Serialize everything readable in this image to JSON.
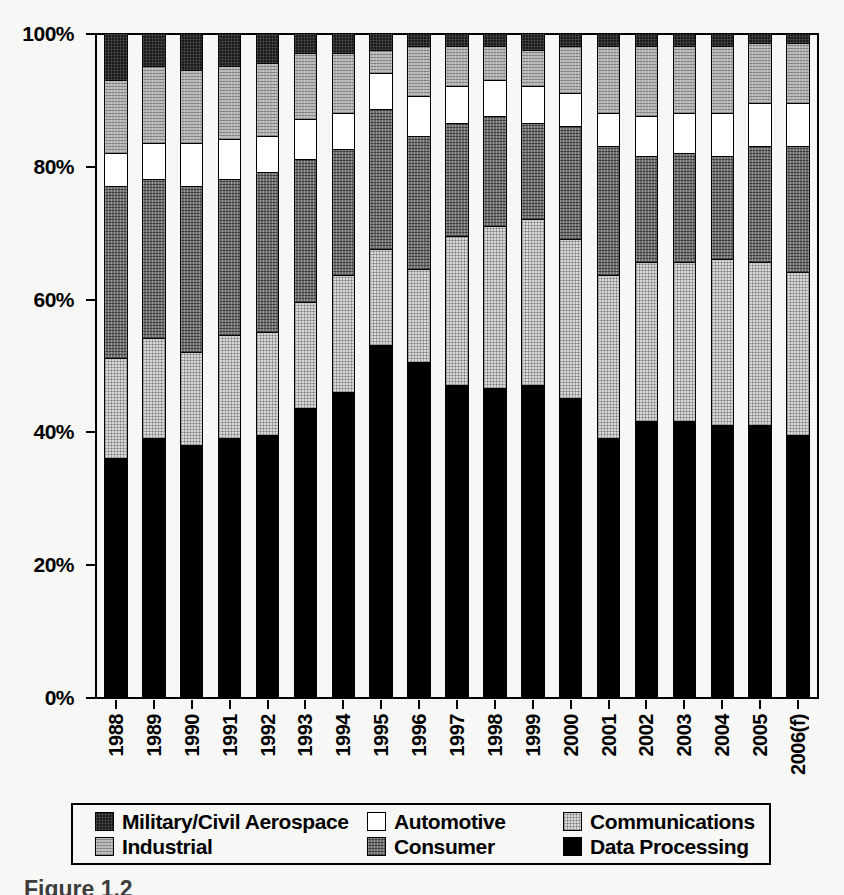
{
  "chart_data": {
    "type": "bar",
    "stacked": true,
    "stack_mode": "percent",
    "title": "",
    "subtitle": "",
    "xlabel": "",
    "ylabel": "",
    "ylim": [
      0,
      100
    ],
    "y_tick_labels": [
      "0%",
      "20%",
      "40%",
      "60%",
      "80%",
      "100%"
    ],
    "y_ticks": [
      0,
      20,
      40,
      60,
      80,
      100
    ],
    "grid": false,
    "legend_position": "bottom",
    "categories": [
      "1988",
      "1989",
      "1990",
      "1991",
      "1992",
      "1993",
      "1994",
      "1995",
      "1996",
      "1997",
      "1998",
      "1999",
      "2000",
      "2001",
      "2002",
      "2003",
      "2004",
      "2005",
      "2006(f)"
    ],
    "stack_order_bottom_to_top": [
      "Data Processing",
      "Communications",
      "Consumer",
      "Automotive",
      "Industrial",
      "Military/Civil Aerospace"
    ],
    "series": [
      {
        "name": "Data Processing",
        "color": "#000000",
        "values": [
          36.0,
          39.0,
          38.0,
          39.0,
          39.5,
          43.5,
          46.0,
          53.0,
          50.5,
          47.0,
          46.5,
          47.0,
          45.0,
          39.0,
          41.5,
          41.5,
          41.0,
          41.0,
          39.5
        ]
      },
      {
        "name": "Communications",
        "color": "#d8d8d8",
        "values": [
          15.0,
          15.0,
          14.0,
          15.5,
          15.5,
          16.0,
          17.5,
          14.5,
          14.0,
          22.5,
          24.5,
          25.0,
          24.0,
          24.5,
          24.0,
          24.0,
          25.0,
          24.5,
          24.5
        ]
      },
      {
        "name": "Consumer",
        "color": "#6e6e6e",
        "values": [
          26.0,
          24.0,
          25.0,
          23.5,
          24.0,
          21.5,
          19.0,
          21.0,
          20.0,
          17.0,
          16.5,
          14.5,
          17.0,
          19.5,
          16.0,
          16.5,
          15.5,
          17.5,
          19.0
        ]
      },
      {
        "name": "Automotive",
        "color": "#ffffff",
        "values": [
          5.0,
          5.5,
          6.5,
          6.0,
          5.5,
          6.0,
          5.5,
          5.5,
          6.0,
          5.5,
          5.5,
          5.5,
          5.0,
          5.0,
          6.0,
          6.0,
          6.5,
          6.5,
          6.5
        ]
      },
      {
        "name": "Industrial",
        "color": "#b4b4b4",
        "values": [
          11.0,
          11.5,
          11.0,
          11.0,
          11.0,
          10.0,
          9.0,
          3.5,
          7.5,
          6.0,
          5.0,
          5.5,
          7.0,
          10.0,
          10.5,
          10.0,
          10.0,
          9.0,
          9.0
        ]
      },
      {
        "name": "Military/Civil Aerospace",
        "color": "#1a1a1a",
        "values": [
          7.0,
          5.0,
          5.5,
          5.0,
          4.5,
          3.0,
          3.0,
          2.5,
          2.0,
          2.0,
          2.0,
          2.5,
          2.0,
          2.0,
          2.0,
          2.0,
          2.0,
          1.5,
          1.5
        ]
      }
    ]
  },
  "legend": {
    "rows": [
      [
        {
          "label": "Military/Civil Aerospace",
          "swatch": "military-swatch",
          "fill_class": "fill-military"
        },
        {
          "label": "Automotive",
          "swatch": "automotive-swatch",
          "fill_class": "fill-auto"
        },
        {
          "label": "Communications",
          "swatch": "communications-swatch",
          "fill_class": "fill-comm"
        }
      ],
      [
        {
          "label": "Industrial",
          "swatch": "industrial-swatch",
          "fill_class": "fill-industrial"
        },
        {
          "label": "Consumer",
          "swatch": "consumer-swatch",
          "fill_class": "fill-consumer"
        },
        {
          "label": "Data Processing",
          "swatch": "data-processing-swatch",
          "fill_class": "fill-dataproc"
        }
      ]
    ]
  },
  "caption": {
    "text": "Figure 1.2"
  }
}
